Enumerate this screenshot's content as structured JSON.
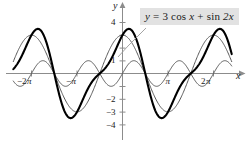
{
  "figure": {
    "callout_label": "y = 3 cos x + sin 2x",
    "callout_parts": {
      "lhs": "y",
      "eq": " = 3 ",
      "cos": "cos",
      "var1": " x ",
      "plus": "+ ",
      "sin": "sin",
      "var2": " 2x"
    },
    "x_axis_name": "x",
    "y_axis_name": "y",
    "background_color": "#ffffff",
    "callout_background": "#e2e2e2",
    "bold_curve_color": "#000000",
    "thin_curve_color": "#595959",
    "axis_color": "#8c8c8c"
  },
  "chart_data": {
    "type": "line",
    "title": "",
    "subtitle": "",
    "xlabel": "x",
    "ylabel": "y",
    "xlim": [
      -7.5398,
      7.5398
    ],
    "ylim": [
      -4.6,
      4.6
    ],
    "grid": false,
    "legend_position": "callout-top-right",
    "annotations": [
      {
        "text": "y = 3 cos x + sin 2x",
        "target": "bold sum curve",
        "leader_line": true
      }
    ],
    "x_ticks": [
      -6.2832,
      -3.1416,
      3.1416,
      6.2832
    ],
    "x_tick_labels": [
      "−2π",
      "−π",
      "π",
      "2π"
    ],
    "y_ticks": [
      -4,
      -3,
      -2,
      -1,
      1,
      2,
      3,
      4
    ],
    "y_tick_labels": [
      "−4",
      "−3",
      "−2",
      "",
      "1",
      "",
      "",
      "4"
    ],
    "series": [
      {
        "name": "y = 3 cos x",
        "expression": "3*cos(x)",
        "amplitude": 3,
        "period": 6.2832,
        "style": "thin",
        "color": "#595959"
      },
      {
        "name": "y = sin 2x",
        "expression": "sin(2*x)",
        "amplitude": 1,
        "period": 3.1416,
        "style": "thin",
        "color": "#595959"
      },
      {
        "name": "y = 3 cos x + sin 2x",
        "expression": "3*cos(x) + sin(2*x)",
        "amplitude": 3.48,
        "period": 6.2832,
        "style": "bold",
        "color": "#000000"
      }
    ]
  },
  "tick_labels": {
    "x_neg_two_pi": {
      "minus": "−2",
      "pi": "π"
    },
    "x_neg_pi": {
      "minus": "−",
      "pi": "π"
    },
    "x_pi": {
      "minus": "",
      "pi": "π"
    },
    "x_two_pi": {
      "minus": "2",
      "pi": "π"
    },
    "y_four": "4",
    "y_one": "1",
    "y_neg_two": "−2",
    "y_neg_three": "−3",
    "y_neg_four": "−4"
  }
}
